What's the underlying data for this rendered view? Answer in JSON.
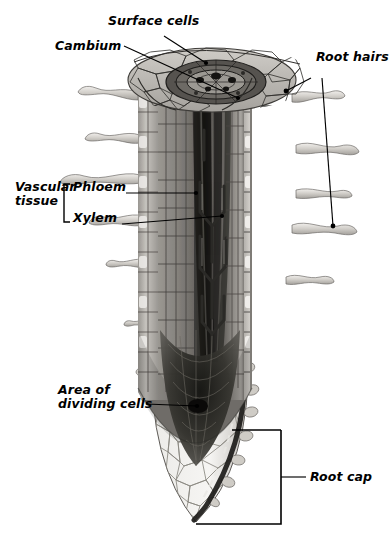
{
  "labels": {
    "surface_cells": "Surface cells",
    "cambium": "Cambium",
    "root_hairs": "Root hairs",
    "vascular_tissue_line1": "Vascular",
    "vascular_tissue_line2": "tissue",
    "phloem": "Phloem",
    "xylem": "Xylem",
    "area_dividing_line1": "Area of",
    "area_dividing_line2": "dividing cells",
    "root_cap": "Root cap"
  },
  "colors": {
    "ink": "#000000",
    "background": "#ffffff",
    "epidermis": "#c9c6c1",
    "cortex_light": "#a7a49f",
    "cortex_mid": "#8d8a85",
    "cortex_dark": "#6e6b67",
    "stele_dark": "#4a4845",
    "vessel_shadow": "#2e2d2b",
    "meristem": "#3a3937",
    "rootcap": "#efeeeb",
    "roothair": "#d6d3ce"
  },
  "structures": [
    {
      "name": "epidermis",
      "label": "Surface cells"
    },
    {
      "name": "cambium",
      "label": "Cambium"
    },
    {
      "name": "phloem",
      "label": "Phloem"
    },
    {
      "name": "xylem",
      "label": "Xylem"
    },
    {
      "name": "apical-meristem",
      "label": "Area of dividing cells"
    },
    {
      "name": "root-cap",
      "label": "Root cap"
    },
    {
      "name": "root-hairs",
      "label": "Root hairs"
    }
  ]
}
